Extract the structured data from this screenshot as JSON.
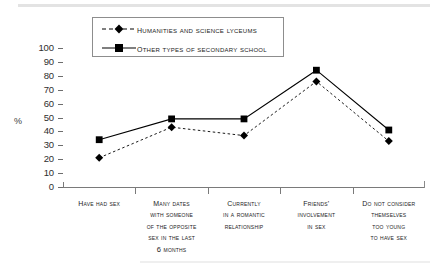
{
  "chart_data": {
    "type": "line",
    "title": "",
    "xlabel": "",
    "ylabel": "%",
    "ylim": [
      0,
      100
    ],
    "ytick_step": 10,
    "yticks": [
      100,
      90,
      80,
      70,
      60,
      50,
      40,
      30,
      20,
      10,
      0
    ],
    "grid": false,
    "legend_position": "top-center",
    "categories": [
      "Have had sex",
      "Many dates with someone of the opposite sex in the last 6 months",
      "Currently in a romantic relationship",
      "Friends' involvement in sex",
      "Do not consider themselves too young to have sex"
    ],
    "category_lines": [
      [
        "Have had sex"
      ],
      [
        "Many dates",
        "with someone",
        "of the opposite",
        "sex in the last",
        "6 months"
      ],
      [
        "Currently",
        "in a romantic",
        "relationship"
      ],
      [
        "Friends'",
        "involvement",
        "in sex"
      ],
      [
        "Do not consider",
        "themselves",
        "too young",
        "to have sex"
      ]
    ],
    "series": [
      {
        "name": "Humanities and science lyceums",
        "values": [
          21,
          43,
          37,
          76,
          33
        ],
        "marker": "diamond",
        "line_style": "dashed",
        "color": "#000000"
      },
      {
        "name": "Other types of secondary school",
        "values": [
          34,
          49,
          49,
          84,
          41
        ],
        "marker": "square",
        "line_style": "solid",
        "color": "#000000"
      }
    ]
  },
  "legend": {
    "items": [
      {
        "label": "Humanities and science lyceums",
        "marker": "diamond-marker",
        "style": "dashed"
      },
      {
        "label": "Other types of secondary school",
        "marker": "square-marker",
        "style": "solid"
      }
    ]
  },
  "axis": {
    "y_unit_label": "%"
  }
}
